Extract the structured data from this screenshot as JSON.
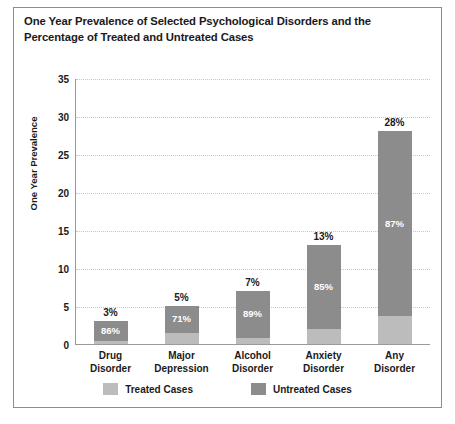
{
  "chart_data": {
    "type": "bar",
    "title": "One Year Prevalence of Selected Psychological Disorders and the Percentage of Treated and Untreated Cases",
    "xlabel": "",
    "ylabel": "One Year Prevalence",
    "ylim": [
      0,
      35
    ],
    "yticks": [
      0,
      5,
      10,
      15,
      20,
      25,
      30,
      35
    ],
    "ytick_labels": [
      "0",
      "5",
      "10",
      "15",
      "20",
      "25",
      "30",
      "35"
    ],
    "grid": true,
    "stacked": true,
    "legend_position": "bottom",
    "categories": [
      "Drug Disorder",
      "Major Depression",
      "Alcohol Disorder",
      "Anxiety Disorder",
      "Any Disorder"
    ],
    "category_lines": [
      [
        "Drug",
        "Disorder"
      ],
      [
        "Major",
        "Depression"
      ],
      [
        "Alcohol",
        "Disorder"
      ],
      [
        "Anxiety",
        "Disorder"
      ],
      [
        "Any",
        "Disorder"
      ]
    ],
    "values": [
      3,
      5,
      7,
      13,
      28
    ],
    "total_labels": [
      "3%",
      "5%",
      "7%",
      "13%",
      "28%"
    ],
    "untreated_pct": [
      86,
      71,
      89,
      85,
      87
    ],
    "untreated_labels": [
      "86%",
      "71%",
      "89%",
      "85%",
      "87%"
    ],
    "treated_pct": [
      14,
      29,
      11,
      15,
      13
    ],
    "series": [
      {
        "name": "Treated Cases",
        "color": "#bcbcbc",
        "values": [
          0.42,
          1.45,
          0.77,
          1.95,
          3.64
        ]
      },
      {
        "name": "Untreated Cases",
        "color": "#8c8c8c",
        "values": [
          2.58,
          3.55,
          6.23,
          11.05,
          24.36
        ]
      }
    ],
    "legend": [
      {
        "label": "Treated Cases",
        "color": "#bcbcbc",
        "swatch_name": "legend-swatch-treated"
      },
      {
        "label": "Untreated Cases",
        "color": "#8c8c8c",
        "swatch_name": "legend-swatch-untreated"
      }
    ]
  },
  "colors": {
    "treated": "#bcbcbc",
    "untreated": "#8c8c8c",
    "axis": "#9a9a9a",
    "grid": "#c6c6c6",
    "frame": "#8c8c8c",
    "text": "#1a1a1a",
    "background": "#ffffff"
  }
}
